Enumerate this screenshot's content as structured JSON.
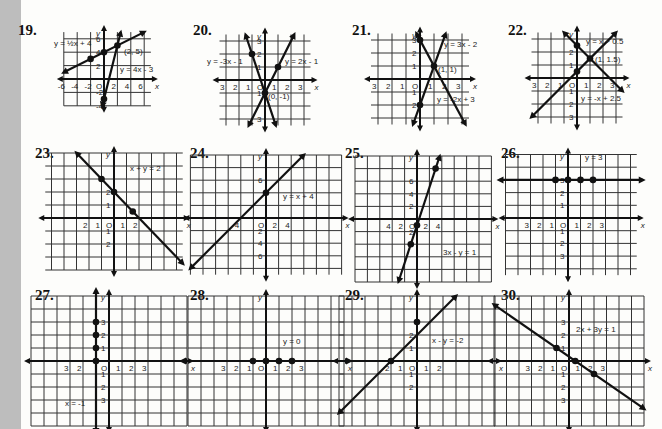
{
  "page": {
    "background": "#fdfdfb",
    "margin_strip": "#bdbdbd",
    "ink": "#111111"
  },
  "problems": [
    {
      "number": "19.",
      "x": 18,
      "y": 22,
      "origin": [
        104,
        79
      ],
      "unit": [
        6.7,
        6.7
      ],
      "xlim": [
        -6,
        7
      ],
      "ylim": [
        -4,
        7
      ],
      "xticks": [
        "-6",
        "-4",
        "-2",
        "2",
        "4",
        "6"
      ],
      "xtick_vals": [
        -6,
        -4,
        -2,
        2,
        4,
        6
      ],
      "yticks": [
        "6",
        "4",
        "2",
        "-2",
        "-4"
      ],
      "ytick_vals": [
        6,
        4,
        2,
        -2,
        -4
      ],
      "lines": [
        {
          "m": 0.5,
          "b": 4,
          "label": "y = 1/2x + 4"
        },
        {
          "m": 4,
          "b": -3,
          "label": "y = 4x - 3"
        }
      ],
      "points": [
        [
          -2,
          3
        ],
        [
          0,
          4
        ],
        [
          2,
          5
        ],
        [
          0,
          -3
        ]
      ],
      "labels": [
        {
          "text": "y = ½x + 4",
          "x": 54,
          "y": 46
        },
        {
          "text": "(2, 5)",
          "x": 124,
          "y": 54
        },
        {
          "text": "y = 4x - 3",
          "x": 120,
          "y": 72
        }
      ]
    },
    {
      "number": "20.",
      "x": 193,
      "y": 22,
      "origin": [
        265,
        80
      ],
      "unit": [
        13,
        13
      ],
      "xlim": [
        -3.5,
        3.5
      ],
      "ylim": [
        -3.5,
        3.5
      ],
      "xticks": [
        "3",
        "2",
        "1",
        "1",
        "2",
        "3"
      ],
      "xtick_vals": [
        -3,
        -2,
        -1,
        1,
        2,
        3
      ],
      "yticks": [
        "3",
        "2",
        "1",
        "1",
        "3"
      ],
      "ytick_vals": [
        3,
        2,
        1,
        -1,
        -3
      ],
      "lines": [
        {
          "m": -3,
          "b": -1,
          "label": "y = -3x - 1"
        },
        {
          "m": 2,
          "b": -1,
          "label": "y = 2x - 1"
        }
      ],
      "points": [
        [
          -1,
          2
        ],
        [
          1,
          1
        ],
        [
          0,
          -1
        ]
      ],
      "labels": [
        {
          "text": "y = -3x - 1",
          "x": 207,
          "y": 64
        },
        {
          "text": "y = 2x - 1",
          "x": 285,
          "y": 64
        },
        {
          "text": "(0, -1)",
          "x": 268,
          "y": 99
        }
      ]
    },
    {
      "number": "21.",
      "x": 352,
      "y": 22,
      "origin": [
        420,
        79
      ],
      "unit": [
        14,
        13
      ],
      "xlim": [
        -3.5,
        3.5
      ],
      "ylim": [
        -3.5,
        3.5
      ],
      "xticks": [
        "3",
        "2",
        "1",
        "1",
        "2",
        "3"
      ],
      "xtick_vals": [
        -3,
        -2,
        -1,
        1,
        2,
        3
      ],
      "yticks": [
        "3",
        "2",
        "1",
        "1",
        "2"
      ],
      "ytick_vals": [
        3,
        2,
        1,
        -1,
        -2
      ],
      "lines": [
        {
          "m": 3,
          "b": -2,
          "label": "y = 3x - 2"
        },
        {
          "m": -2,
          "b": 3,
          "label": "y = -2x + 3"
        }
      ],
      "points": [
        [
          0,
          3
        ],
        [
          1,
          1
        ],
        [
          0,
          -2
        ]
      ],
      "labels": [
        {
          "text": "y = 3x - 2",
          "x": 444,
          "y": 47
        },
        {
          "text": "(1, 1)",
          "x": 438,
          "y": 72
        },
        {
          "text": "y = -2x + 3",
          "x": 437,
          "y": 102
        }
      ]
    },
    {
      "number": "22.",
      "x": 508,
      "y": 22,
      "origin": [
        577,
        78
      ],
      "unit": [
        13,
        13
      ],
      "xlim": [
        -3.5,
        3.5
      ],
      "ylim": [
        -3.5,
        3.5
      ],
      "xticks": [
        "3",
        "2",
        "1",
        "1",
        "2",
        "3"
      ],
      "xtick_vals": [
        -3,
        -2,
        -1,
        1,
        2,
        3
      ],
      "yticks": [
        "2",
        "1",
        "1",
        "2",
        "3"
      ],
      "ytick_vals": [
        2,
        1,
        -1,
        -2,
        -3
      ],
      "lines": [
        {
          "m": 1,
          "b": 0.5,
          "label": "y = x + 0.5"
        },
        {
          "m": -1,
          "b": 2.5,
          "label": "y = -x + 2.5"
        }
      ],
      "points": [
        [
          0,
          2.5
        ],
        [
          1,
          1.5
        ],
        [
          0,
          0.5
        ]
      ],
      "labels": [
        {
          "text": "y = x + 0.5",
          "x": 586,
          "y": 44
        },
        {
          "text": "(1, 1.5)",
          "x": 595,
          "y": 62
        },
        {
          "text": "y = -x + 2.5",
          "x": 581,
          "y": 101
        }
      ]
    },
    {
      "number": "23.",
      "x": 35,
      "y": 145,
      "origin": [
        114,
        218
      ],
      "unit": [
        12.5,
        13
      ],
      "xlim": [
        -5.5,
        5.5
      ],
      "ylim": [
        -4,
        5
      ],
      "xticks": [
        "2",
        "1",
        "1",
        "2"
      ],
      "xtick_vals": [
        -2,
        -1,
        1,
        2
      ],
      "yticks": [
        "2",
        "1",
        "1",
        "2"
      ],
      "ytick_vals": [
        2,
        1,
        -1,
        -2
      ],
      "lines": [
        {
          "m": -1,
          "b": 2,
          "label": "x + y = 2"
        }
      ],
      "points": [
        [
          -1,
          3
        ],
        [
          0,
          2
        ],
        [
          1.5,
          0.5
        ]
      ],
      "labels": [
        {
          "text": "x + y = 2",
          "x": 130,
          "y": 171
        }
      ]
    },
    {
      "number": "24.",
      "x": 190,
      "y": 145,
      "origin": [
        266,
        218
      ],
      "unit": [
        6.3,
        6.3
      ],
      "xlim": [
        -12,
        12
      ],
      "ylim": [
        -9,
        10
      ],
      "xticks": [
        "4",
        "2",
        "4"
      ],
      "xtick_vals": [
        -4,
        2,
        4
      ],
      "yticks": [
        "6",
        "2",
        "4",
        "6"
      ],
      "ytick_vals": [
        6,
        -2,
        -4,
        -6
      ],
      "lines": [
        {
          "m": 1,
          "b": 4,
          "label": "y = x + 4"
        }
      ],
      "points": [
        [
          0,
          4
        ]
      ],
      "labels": [
        {
          "text": "y = x + 4",
          "x": 283,
          "y": 199
        }
      ]
    },
    {
      "number": "25.",
      "x": 345,
      "y": 145,
      "origin": [
        417,
        219
      ],
      "unit": [
        6.2,
        6.3
      ],
      "xlim": [
        -10,
        12
      ],
      "ylim": [
        -10,
        10
      ],
      "xticks": [
        "4",
        "2",
        "2",
        "4"
      ],
      "xtick_vals": [
        -4,
        -2,
        2,
        4
      ],
      "yticks": [
        "6",
        "4",
        "2",
        "2",
        "4"
      ],
      "ytick_vals": [
        6,
        4,
        2,
        -2,
        -4
      ],
      "lines": [
        {
          "m": 3,
          "b": -1,
          "label": "3x - y = 1"
        }
      ],
      "points": [
        [
          3,
          8
        ],
        [
          0,
          -1
        ],
        [
          -1,
          -4
        ]
      ],
      "labels": [
        {
          "text": "3x - y = 1",
          "x": 443,
          "y": 255
        }
      ]
    },
    {
      "number": "26.",
      "x": 501,
      "y": 145,
      "origin": [
        568,
        218
      ],
      "unit": [
        12.5,
        12.7
      ],
      "xlim": [
        -5,
        5.5
      ],
      "ylim": [
        -4.5,
        5
      ],
      "xticks": [
        "3",
        "2",
        "1",
        "1",
        "2",
        "3"
      ],
      "xtick_vals": [
        -3,
        -2,
        -1,
        1,
        2,
        3
      ],
      "yticks": [
        "3",
        "2",
        "1",
        "1",
        "2",
        "3"
      ],
      "ytick_vals": [
        3,
        2,
        1,
        -1,
        -2,
        -3
      ],
      "lines": [
        {
          "h": 3,
          "label": "y = 3"
        }
      ],
      "points": [
        [
          -1,
          3
        ],
        [
          0,
          3
        ],
        [
          1,
          3
        ],
        [
          2,
          3
        ]
      ],
      "labels": [
        {
          "text": "y = 3",
          "x": 585,
          "y": 160
        }
      ]
    },
    {
      "number": "27.",
      "x": 35,
      "y": 287,
      "origin": [
        109,
        361
      ],
      "unit": [
        13,
        13
      ],
      "xlim": [
        -6,
        6
      ],
      "ylim": [
        -5,
        5
      ],
      "xticks": [
        "3",
        "2",
        "1",
        "2",
        "3"
      ],
      "xtick_vals": [
        -3,
        -2,
        1,
        2,
        3
      ],
      "yticks": [
        "3",
        "2",
        "1",
        "1",
        "2",
        "3"
      ],
      "ytick_vals": [
        3,
        2,
        1,
        -1,
        -2,
        -3
      ],
      "lines": [
        {
          "v": -1,
          "label": "x = -1"
        }
      ],
      "points": [
        [
          -1,
          3
        ],
        [
          -1,
          2
        ],
        [
          -1,
          1
        ],
        [
          -1,
          0
        ]
      ],
      "labels": [
        {
          "text": "x = -1",
          "x": 65,
          "y": 406
        }
      ]
    },
    {
      "number": "28.",
      "x": 190,
      "y": 287,
      "origin": [
        266,
        361
      ],
      "unit": [
        13,
        13
      ],
      "xlim": [
        -6,
        6
      ],
      "ylim": [
        -5,
        5
      ],
      "xticks": [
        "3",
        "2",
        "1",
        "1",
        "2",
        "3"
      ],
      "xtick_vals": [
        -3,
        -2,
        -1,
        1,
        2,
        3
      ],
      "yticks": [],
      "ytick_vals": [],
      "lines": [
        {
          "h": 0,
          "label": "y = 0"
        }
      ],
      "points": [
        [
          -1,
          0
        ],
        [
          0,
          0
        ],
        [
          1,
          0
        ],
        [
          2,
          0
        ]
      ],
      "labels": [
        {
          "text": "y = 0",
          "x": 283,
          "y": 344
        }
      ]
    },
    {
      "number": "29.",
      "x": 345,
      "y": 287,
      "origin": [
        417,
        361
      ],
      "unit": [
        13,
        13
      ],
      "xlim": [
        -6,
        6
      ],
      "ylim": [
        -5,
        5
      ],
      "xticks": [
        "2",
        "1",
        "1",
        "2"
      ],
      "xtick_vals": [
        -2,
        -1,
        1,
        2
      ],
      "yticks": [
        "2",
        "1",
        "1",
        "2"
      ],
      "ytick_vals": [
        2,
        1,
        -1,
        -2
      ],
      "lines": [
        {
          "m": 1,
          "b": 2,
          "label": "x - y = -2"
        }
      ],
      "points": [
        [
          0,
          3
        ],
        [
          -2,
          0
        ]
      ],
      "labels": [
        {
          "text": "x - y = -2",
          "x": 432,
          "y": 343
        }
      ]
    },
    {
      "number": "30.",
      "x": 501,
      "y": 287,
      "origin": [
        569,
        361
      ],
      "unit": [
        12.5,
        13
      ],
      "xlim": [
        -6,
        6
      ],
      "ylim": [
        -5,
        5
      ],
      "xticks": [
        "3",
        "2",
        "1",
        "1",
        "2",
        "3"
      ],
      "xtick_vals": [
        -3,
        -2,
        -1,
        1,
        2,
        3
      ],
      "yticks": [
        "3",
        "2",
        "1",
        "1",
        "2",
        "3"
      ],
      "ytick_vals": [
        3,
        2,
        1,
        -1,
        -2,
        -3
      ],
      "lines": [
        {
          "m": -0.6667,
          "b": 0.3333,
          "label": "2x + 3y = 1"
        }
      ],
      "points": [
        [
          -1,
          1
        ],
        [
          0.5,
          0
        ],
        [
          2,
          -1
        ]
      ],
      "labels": [
        {
          "text": "2x + 3y = 1",
          "x": 576,
          "y": 332
        }
      ]
    }
  ]
}
